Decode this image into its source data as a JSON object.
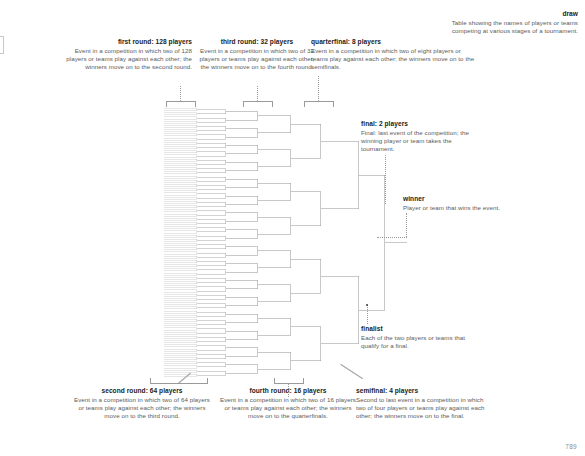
{
  "page": {
    "number": "789",
    "background_color": "#ffffff",
    "text_color": "#5b5b5b",
    "term_color": "#1c1c1c",
    "line_color": "#9a9a9a"
  },
  "annotations": {
    "draw": {
      "term": "draw",
      "definition": "Table showing the names of players or teams competing at various stages of a tournament."
    },
    "first_round": {
      "term": "first round: 128 players",
      "definition": "Event in a competition in which two of 128 players or teams play against each other; the winners move on to the second round."
    },
    "second_round": {
      "term": "second round: 64 players",
      "definition": "Event in a competition in which two of 64 players or teams play against each other; the winners move on to the third round."
    },
    "third_round": {
      "term": "third round: 32 players",
      "definition": "Event in a competition in which two of 32 players or teams play against each other; the winners move on to the fourth round."
    },
    "fourth_round": {
      "term": "fourth round: 16 players",
      "definition": "Event in a competition in which two of 16 players or teams play against each other; the winners move on to the quarterfinals."
    },
    "quarterfinal": {
      "term": "quarterfinal: 8 players",
      "definition": "Event in a competition in which two of eight players or teams play against each other; the winners move on to the semifinals."
    },
    "semifinal": {
      "term": "semifinal: 4 players",
      "definition": "Second to last event in a competition in which two of four players or teams play against each other; the winners move on to the final."
    },
    "final": {
      "term": "final: 2 players",
      "definition": "Final: last event of the competition; the winning player or team takes the tournament."
    },
    "finalist": {
      "term": "finalist",
      "definition": "Each of the two players or teams that qualify for a final."
    },
    "winner": {
      "term": "winner",
      "definition": "Player or team that wins the event."
    }
  },
  "chart_data": {
    "type": "diagram",
    "title": "draw",
    "rounds": [
      {
        "name": "first round",
        "players": 128,
        "matches": 64
      },
      {
        "name": "second round",
        "players": 64,
        "matches": 32
      },
      {
        "name": "third round",
        "players": 32,
        "matches": 16
      },
      {
        "name": "fourth round",
        "players": 16,
        "matches": 8
      },
      {
        "name": "quarterfinal",
        "players": 8,
        "matches": 4
      },
      {
        "name": "semifinal",
        "players": 4,
        "matches": 2
      },
      {
        "name": "final",
        "players": 2,
        "matches": 1
      },
      {
        "name": "winner",
        "players": 1,
        "matches": 0
      }
    ]
  }
}
